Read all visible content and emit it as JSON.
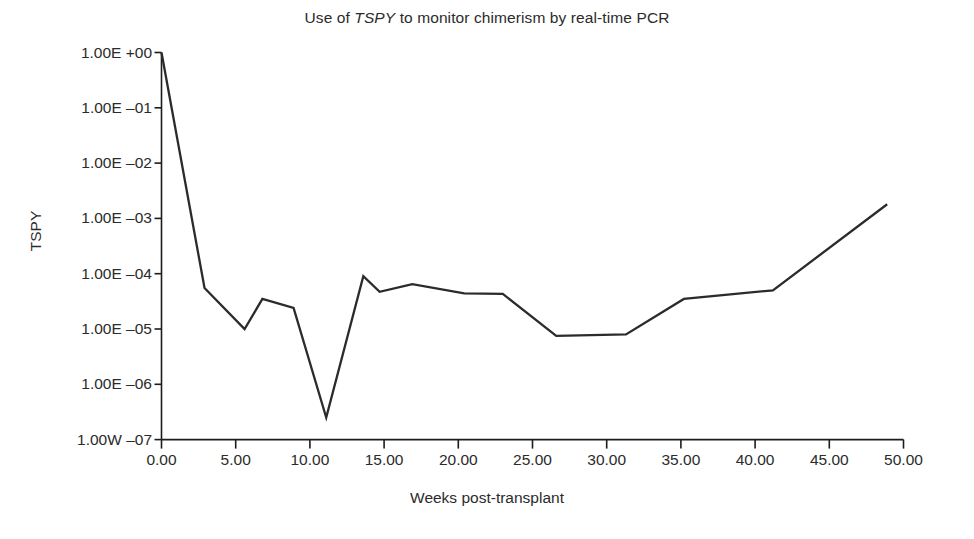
{
  "figure": {
    "title_prefix": "Use of ",
    "title_gene": "TSPY",
    "title_suffix": " to monitor chimerism by real-time PCR",
    "title_full": "Use of TSPY to monitor chimerism by real-time PCR",
    "line_color": "#2b2b2b",
    "axis_color": "#1c1c1c",
    "background": "#ffffff"
  },
  "chart_data": {
    "type": "line",
    "title": "Use of TSPY to monitor chimerism by real-time PCR",
    "xlabel": "Weeks post-transplant",
    "ylabel": "TSPY",
    "yscale": "log",
    "xlim": [
      0,
      50
    ],
    "ylim": [
      1e-07,
      1
    ],
    "grid": false,
    "legend": null,
    "xticks": [
      0,
      5,
      10,
      15,
      20,
      25,
      30,
      35,
      40,
      45,
      50
    ],
    "xticklabels": [
      "0.00",
      "5.00",
      "10.00",
      "15.00",
      "20.00",
      "25.00",
      "30.00",
      "35.00",
      "40.00",
      "45.00",
      "50.00"
    ],
    "yticks": [
      1,
      0.1,
      0.01,
      0.001,
      0.0001,
      1e-05,
      1e-06,
      1e-07
    ],
    "yticklabels": [
      "1.00E +00",
      "1.00E ‒01",
      "1.00E ‒02",
      "1.00E ‒03",
      "1.00E ‒04",
      "1.00E ‒05",
      "1.00E ‒06",
      "1.00W ‒07"
    ],
    "series": [
      {
        "name": "TSPY",
        "x": [
          0.0,
          2.9,
          5.6,
          6.8,
          8.9,
          11.1,
          13.6,
          14.7,
          16.9,
          20.4,
          23.0,
          26.6,
          31.3,
          35.2,
          41.2,
          48.9
        ],
        "y": [
          1.0,
          5.5e-05,
          1e-05,
          3.5e-05,
          2.4e-05,
          2.5e-07,
          9e-05,
          4.7e-05,
          6.5e-05,
          4.4e-05,
          4.3e-05,
          7.5e-06,
          8e-06,
          3.5e-05,
          5e-05,
          0.0018
        ]
      }
    ]
  }
}
